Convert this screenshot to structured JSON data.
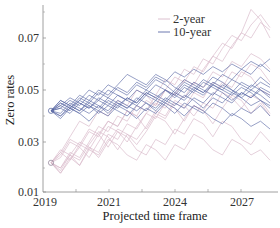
{
  "chart_data": {
    "type": "line",
    "title": "",
    "xlabel": "Projected time frame",
    "ylabel": "Zero rates",
    "xticks": [
      "2019",
      "2021",
      "2024",
      "2027"
    ],
    "yticks": [
      "0.01",
      "0.03",
      "0.05",
      "0.07"
    ],
    "ylim": [
      0.01,
      0.081
    ],
    "xlim": [
      2019,
      2028.5
    ],
    "grid": false,
    "legend_position": "upper center",
    "legend": [
      "2-year",
      "10-year"
    ],
    "colors": {
      "2-year": "#d8b9c9",
      "10-year": "#5b6aa6"
    },
    "series": [
      {
        "name": "2-year",
        "start": 0.022,
        "paths": [
          [
            0.022,
            0.018,
            0.024,
            0.021,
            0.028,
            0.026,
            0.033,
            0.031,
            0.037,
            0.035,
            0.041,
            0.045,
            0.043,
            0.049,
            0.047,
            0.053,
            0.051,
            0.057,
            0.055,
            0.061,
            0.059,
            0.064,
            0.062,
            0.058
          ],
          [
            0.022,
            0.026,
            0.023,
            0.029,
            0.027,
            0.033,
            0.038,
            0.036,
            0.042,
            0.04,
            0.046,
            0.044,
            0.05,
            0.048,
            0.054,
            0.052,
            0.058,
            0.063,
            0.061,
            0.067,
            0.072,
            0.07,
            0.076,
            0.073
          ],
          [
            0.022,
            0.019,
            0.025,
            0.03,
            0.028,
            0.024,
            0.03,
            0.035,
            0.033,
            0.029,
            0.034,
            0.04,
            0.038,
            0.033,
            0.039,
            0.044,
            0.042,
            0.037,
            0.043,
            0.048,
            0.046,
            0.041,
            0.045,
            0.04
          ],
          [
            0.022,
            0.025,
            0.031,
            0.029,
            0.035,
            0.033,
            0.028,
            0.034,
            0.032,
            0.027,
            0.025,
            0.031,
            0.029,
            0.035,
            0.033,
            0.039,
            0.037,
            0.032,
            0.038,
            0.036,
            0.031,
            0.029,
            0.034,
            0.03
          ],
          [
            0.022,
            0.02,
            0.026,
            0.024,
            0.03,
            0.036,
            0.034,
            0.04,
            0.038,
            0.044,
            0.042,
            0.048,
            0.054,
            0.052,
            0.058,
            0.056,
            0.062,
            0.06,
            0.066,
            0.071,
            0.069,
            0.075,
            0.079,
            0.074
          ],
          [
            0.022,
            0.027,
            0.025,
            0.021,
            0.027,
            0.025,
            0.031,
            0.029,
            0.025,
            0.023,
            0.029,
            0.027,
            0.023,
            0.029,
            0.027,
            0.033,
            0.031,
            0.027,
            0.025,
            0.031,
            0.029,
            0.025,
            0.027,
            0.023
          ],
          [
            0.022,
            0.018,
            0.023,
            0.028,
            0.034,
            0.032,
            0.038,
            0.036,
            0.042,
            0.04,
            0.035,
            0.041,
            0.039,
            0.045,
            0.043,
            0.049,
            0.047,
            0.053,
            0.051,
            0.057,
            0.055,
            0.06,
            0.058,
            0.053
          ],
          [
            0.022,
            0.024,
            0.03,
            0.028,
            0.024,
            0.03,
            0.036,
            0.034,
            0.03,
            0.036,
            0.041,
            0.039,
            0.045,
            0.043,
            0.038,
            0.044,
            0.042,
            0.048,
            0.053,
            0.051,
            0.057,
            0.055,
            0.05,
            0.048
          ],
          [
            0.022,
            0.02,
            0.025,
            0.023,
            0.029,
            0.034,
            0.032,
            0.027,
            0.033,
            0.031,
            0.036,
            0.042,
            0.04,
            0.046,
            0.044,
            0.04,
            0.045,
            0.043,
            0.049,
            0.047,
            0.043,
            0.048,
            0.046,
            0.041
          ],
          [
            0.022,
            0.026,
            0.032,
            0.038,
            0.036,
            0.042,
            0.04,
            0.046,
            0.044,
            0.05,
            0.048,
            0.044,
            0.05,
            0.055,
            0.053,
            0.059,
            0.057,
            0.063,
            0.068,
            0.066,
            0.072,
            0.081,
            0.077,
            0.07
          ]
        ]
      },
      {
        "name": "10-year",
        "start": 0.042,
        "paths": [
          [
            0.042,
            0.045,
            0.043,
            0.047,
            0.045,
            0.049,
            0.047,
            0.051,
            0.049,
            0.053,
            0.051,
            0.055,
            0.053,
            0.057,
            0.055,
            0.058,
            0.056,
            0.059,
            0.057,
            0.06,
            0.058,
            0.061,
            0.059,
            0.062
          ],
          [
            0.042,
            0.04,
            0.044,
            0.042,
            0.046,
            0.044,
            0.041,
            0.045,
            0.043,
            0.047,
            0.045,
            0.042,
            0.046,
            0.044,
            0.048,
            0.046,
            0.043,
            0.047,
            0.045,
            0.049,
            0.047,
            0.044,
            0.046,
            0.043
          ],
          [
            0.042,
            0.046,
            0.044,
            0.048,
            0.046,
            0.05,
            0.048,
            0.052,
            0.056,
            0.054,
            0.052,
            0.056,
            0.054,
            0.051,
            0.049,
            0.053,
            0.051,
            0.055,
            0.053,
            0.05,
            0.048,
            0.052,
            0.05,
            0.047
          ],
          [
            0.042,
            0.039,
            0.043,
            0.041,
            0.038,
            0.042,
            0.04,
            0.044,
            0.042,
            0.039,
            0.043,
            0.041,
            0.045,
            0.043,
            0.04,
            0.044,
            0.042,
            0.039,
            0.037,
            0.041,
            0.039,
            0.036,
            0.038,
            0.035
          ],
          [
            0.042,
            0.044,
            0.047,
            0.045,
            0.043,
            0.046,
            0.044,
            0.048,
            0.046,
            0.044,
            0.048,
            0.046,
            0.05,
            0.048,
            0.052,
            0.05,
            0.054,
            0.052,
            0.056,
            0.054,
            0.058,
            0.056,
            0.06,
            0.057
          ],
          [
            0.042,
            0.043,
            0.041,
            0.045,
            0.043,
            0.047,
            0.045,
            0.043,
            0.047,
            0.045,
            0.049,
            0.047,
            0.045,
            0.049,
            0.047,
            0.051,
            0.049,
            0.053,
            0.051,
            0.049,
            0.053,
            0.051,
            0.055,
            0.052
          ],
          [
            0.042,
            0.041,
            0.045,
            0.043,
            0.041,
            0.044,
            0.042,
            0.046,
            0.044,
            0.042,
            0.045,
            0.043,
            0.047,
            0.045,
            0.043,
            0.047,
            0.045,
            0.049,
            0.047,
            0.045,
            0.049,
            0.047,
            0.05,
            0.048
          ],
          [
            0.042,
            0.045,
            0.043,
            0.046,
            0.044,
            0.041,
            0.044,
            0.042,
            0.04,
            0.044,
            0.042,
            0.046,
            0.044,
            0.041,
            0.045,
            0.043,
            0.041,
            0.045,
            0.043,
            0.04,
            0.043,
            0.041,
            0.044,
            0.04
          ],
          [
            0.042,
            0.044,
            0.042,
            0.046,
            0.05,
            0.048,
            0.052,
            0.05,
            0.048,
            0.052,
            0.05,
            0.054,
            0.052,
            0.049,
            0.053,
            0.051,
            0.049,
            0.052,
            0.05,
            0.054,
            0.052,
            0.05,
            0.053,
            0.051
          ],
          [
            0.042,
            0.04,
            0.043,
            0.041,
            0.044,
            0.042,
            0.046,
            0.044,
            0.047,
            0.045,
            0.049,
            0.047,
            0.05,
            0.048,
            0.046,
            0.05,
            0.048,
            0.052,
            0.05,
            0.048,
            0.051,
            0.049,
            0.046,
            0.044
          ],
          [
            0.042,
            0.046,
            0.044,
            0.042,
            0.045,
            0.043,
            0.047,
            0.045,
            0.043,
            0.046,
            0.05,
            0.048,
            0.046,
            0.05,
            0.054,
            0.052,
            0.05,
            0.048,
            0.052,
            0.05,
            0.047,
            0.05,
            0.048,
            0.045
          ],
          [
            0.042,
            0.043,
            0.046,
            0.044,
            0.048,
            0.046,
            0.05,
            0.048,
            0.046,
            0.05,
            0.048,
            0.052,
            0.05,
            0.047,
            0.051,
            0.049,
            0.053,
            0.051,
            0.049,
            0.046,
            0.049,
            0.047,
            0.051,
            0.049
          ]
        ]
      }
    ]
  },
  "axes": {
    "xlabel": "Projected time frame",
    "ylabel": "Zero rates",
    "xticks": [
      {
        "label": "2019",
        "x": 45
      },
      {
        "label": "2021",
        "x": 109
      },
      {
        "label": "2024",
        "x": 175
      },
      {
        "label": "2027",
        "x": 242
      }
    ],
    "yticks": [
      {
        "label": "0.01",
        "value": 0.01
      },
      {
        "label": "0.03",
        "value": 0.03
      },
      {
        "label": "0.05",
        "value": 0.05
      },
      {
        "label": "0.07",
        "value": 0.07
      }
    ]
  },
  "legend": {
    "items": [
      {
        "label": "2-year",
        "color": "#d8b9c9"
      },
      {
        "label": "10-year",
        "color": "#5b6aa6"
      }
    ]
  }
}
